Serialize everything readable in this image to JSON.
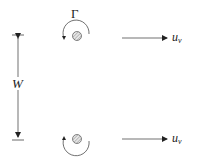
{
  "diagram": {
    "title": "",
    "labels": {
      "circulation": "Γ",
      "width": "W",
      "velocity_top": "u",
      "velocity_top_sub": "v",
      "velocity_bottom": "u",
      "velocity_bottom_sub": "v"
    },
    "vortices": [
      {
        "name": "top",
        "rotation": "counter-clockwise",
        "center": [
          77,
          36
        ]
      },
      {
        "name": "bottom",
        "rotation": "clockwise",
        "center": [
          77,
          139
        ]
      }
    ],
    "colors": {
      "stroke": "#222222",
      "core_fill": "#cfcfcf"
    }
  }
}
